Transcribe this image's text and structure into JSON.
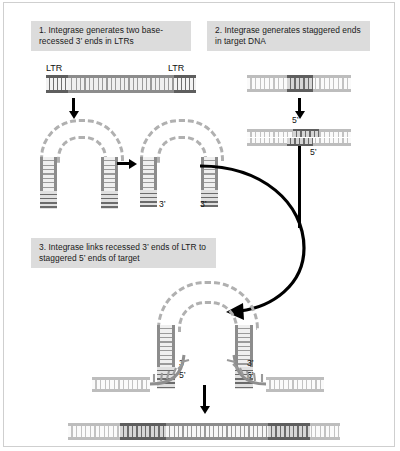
{
  "figure": {
    "type": "molecular-biology-process-diagram"
  },
  "panels": [
    {
      "id": 1,
      "caption": "1. Integrase generates two base-recessed  3’ ends in LTRs"
    },
    {
      "id": 2,
      "caption": "2. Integrase generates staggered ends in target DNA"
    },
    {
      "id": 3,
      "caption": "3. Integrase links recessed 3’ ends of LTR to staggered 5’ ends of target"
    }
  ],
  "labels": {
    "ltr_left": "LTR",
    "ltr_right": "LTR",
    "three_prime": "3’",
    "five_prime": "5’"
  },
  "panel1": {
    "ltr_left_label": "LTR",
    "ltr_right_label": "LTR",
    "hairpin_left_three_prime": "3’",
    "hairpin_right_three_prime": "3’"
  },
  "panel2": {
    "five_prime_top": "5’",
    "five_prime_bottom": "5’"
  },
  "panel3": {
    "left_three_prime": "3’",
    "left_five_prime": "5’",
    "right_three_prime": "3’",
    "right_five_prime": "5’"
  },
  "colors": {
    "caption_background": "#dcdcdc",
    "caption_text": "#1a1a1a",
    "dna_rail": "#8c8c8c",
    "dna_rung_light": "#e8e8e8",
    "ltr_dark": "#6e6e6e",
    "target_dark": "#5f5f5f",
    "loop_dash": "#b0b0b0",
    "arrow": "#000000",
    "frame_border": "#cfcfcf",
    "page_background": "#ffffff"
  }
}
